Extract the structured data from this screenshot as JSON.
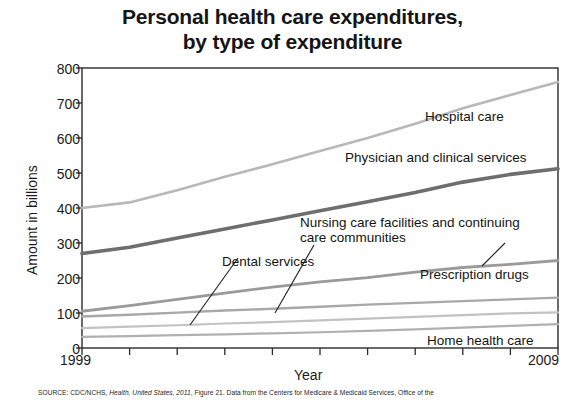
{
  "chart_data": {
    "type": "line",
    "title": "Personal health care expenditures, by type of expenditure",
    "title_line1": "Personal health care expenditures,",
    "title_line2": "by type of expenditure",
    "xlabel": "Year",
    "ylabel": "Amount in billions",
    "xlim": [
      1999,
      2009
    ],
    "ylim": [
      0,
      800
    ],
    "ytick_values": [
      0,
      100,
      200,
      300,
      400,
      500,
      600,
      700,
      800
    ],
    "ytick_labels": [
      "0",
      "100",
      "200",
      "300",
      "400",
      "500",
      "600",
      "700",
      "800"
    ],
    "xtick_values": [
      1999,
      2000,
      2001,
      2002,
      2003,
      2004,
      2005,
      2006,
      2007,
      2008,
      2009
    ],
    "xtick_labels_shown": [
      "1999",
      "2009"
    ],
    "grid": false,
    "legend_position": "inline-annotations",
    "x": [
      1999,
      2000,
      2001,
      2002,
      2003,
      2004,
      2005,
      2006,
      2007,
      2008,
      2009
    ],
    "series": [
      {
        "name": "Hospital care",
        "color": "#b8b8b8",
        "values": [
          400,
          416,
          451,
          489,
          525,
          563,
          600,
          641,
          685,
          723,
          760
        ]
      },
      {
        "name": "Physician and clinical services",
        "color": "#6e6e6e",
        "values": [
          270,
          288,
          314,
          340,
          366,
          392,
          418,
          444,
          474,
          496,
          512
        ]
      },
      {
        "name": "Prescription drugs",
        "color": "#9a9a9a",
        "values": [
          105,
          121,
          139,
          157,
          174,
          189,
          201,
          217,
          230,
          239,
          250
        ]
      },
      {
        "name": "Nursing care facilities and continuing care communities",
        "color": "#a8a8a8",
        "values": [
          90,
          95,
          101,
          107,
          112,
          118,
          124,
          129,
          134,
          139,
          144
        ]
      },
      {
        "name": "Dental services",
        "color": "#c2c2c2",
        "values": [
          57,
          61,
          65,
          70,
          74,
          79,
          84,
          89,
          94,
          99,
          102
        ]
      },
      {
        "name": "Home health care",
        "color": "#b0b0b0",
        "values": [
          32,
          34,
          37,
          39,
          42,
          45,
          49,
          53,
          58,
          63,
          68
        ]
      }
    ],
    "annotations": [
      {
        "id": "hospital-care",
        "text": "Hospital care"
      },
      {
        "id": "physician-and-clinical-services",
        "text": "Physician and clinical services"
      },
      {
        "id": "nursing-care",
        "text": "Nursing care facilities and continuing care communities",
        "line1": "Nursing care facilities and continuing",
        "line2": "care communities"
      },
      {
        "id": "prescription-drugs",
        "text": "Prescription drugs"
      },
      {
        "id": "dental-services",
        "text": "Dental services"
      },
      {
        "id": "home-health-care",
        "text": "Home health care"
      }
    ]
  },
  "source": {
    "prefix": "SOURCE: CDC/NCHS, ",
    "italic": "Health, United States, 2011",
    "suffix": ", Figure 21. Data from the Centers for Medicare & Medicaid Services, Office of the"
  }
}
